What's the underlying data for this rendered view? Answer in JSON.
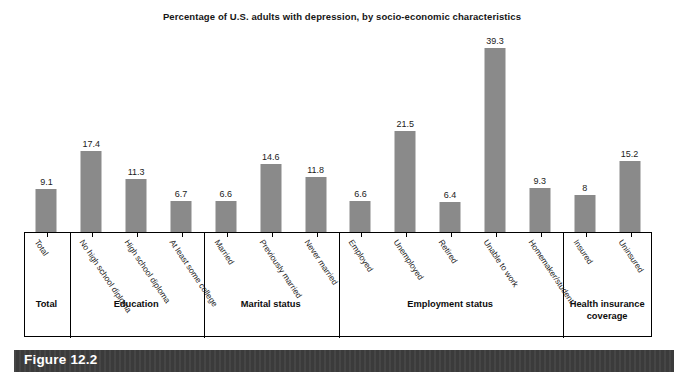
{
  "chart_data": {
    "type": "bar",
    "title": "Percentage of U.S. adults with depression, by socio-economic characteristics",
    "xlabel": "",
    "ylabel": "",
    "ylim": [
      0,
      39.3
    ],
    "grid": false,
    "legend": "none",
    "bar_color": "#8a8a8a",
    "categories": [
      "Total",
      "No high school diploma",
      "High school diploma",
      "At least some college",
      "Married",
      "Previously married",
      "Never married",
      "Employed",
      "Unemployed",
      "Retired",
      "Unable to work",
      "Homemaker/student",
      "Insured",
      "Uninsured"
    ],
    "values": [
      9.1,
      17.4,
      11.3,
      6.7,
      6.6,
      14.6,
      11.8,
      6.6,
      21.5,
      6.4,
      39.3,
      9.3,
      8,
      15.2
    ],
    "value_labels": [
      "9.1",
      "17.4",
      "11.3",
      "6.7",
      "6.6",
      "14.6",
      "11.8",
      "6.6",
      "21.5",
      "6.4",
      "39.3",
      "9.3",
      "8",
      "15.2"
    ],
    "groups": [
      {
        "label": "Total",
        "span": 1
      },
      {
        "label": "Education",
        "span": 3
      },
      {
        "label": "Marital status",
        "span": 3
      },
      {
        "label": "Employment status",
        "span": 5
      },
      {
        "label": "Health insurance coverage",
        "span": 2
      }
    ]
  },
  "figure": {
    "caption": "Figure 12.2",
    "banner_color": "#3b3b3b",
    "caption_color": "#ffffff"
  }
}
